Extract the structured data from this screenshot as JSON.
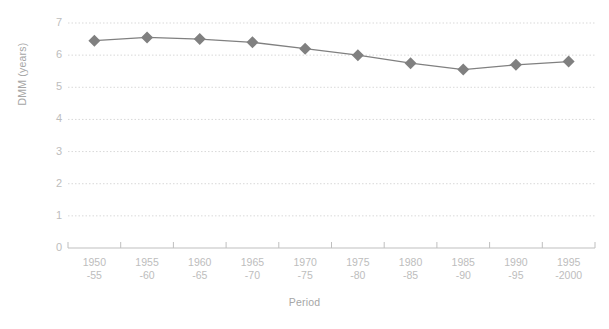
{
  "chart_data": {
    "type": "line",
    "title": "",
    "xlabel": "Period",
    "ylabel": "DMM (years)",
    "ylim": [
      0,
      7
    ],
    "y_ticks": [
      "0",
      "1",
      "2",
      "3",
      "4",
      "5",
      "6",
      "7"
    ],
    "grid": "horizontal-dotted",
    "legend": "none",
    "marker": "diamond",
    "series_color": "#808080",
    "grid_color": "#d9d9d9",
    "axis_color": "#bfbfbf",
    "tick_label_color": "#bdbdbd",
    "categories": [
      "1950-55",
      "1955-60",
      "1960-65",
      "1965-70",
      "1970-75",
      "1975-80",
      "1980-85",
      "1985-90",
      "1990-95",
      "1995-2000"
    ],
    "category_labels": [
      {
        "line1": "1950",
        "line2": "-55"
      },
      {
        "line1": "1955",
        "line2": "-60"
      },
      {
        "line1": "1960",
        "line2": "-65"
      },
      {
        "line1": "1965",
        "line2": "-70"
      },
      {
        "line1": "1970",
        "line2": "-75"
      },
      {
        "line1": "1975",
        "line2": "-80"
      },
      {
        "line1": "1980",
        "line2": "-85"
      },
      {
        "line1": "1985",
        "line2": "-90"
      },
      {
        "line1": "1990",
        "line2": "-95"
      },
      {
        "line1": "1995",
        "line2": "-2000"
      }
    ],
    "values": [
      6.45,
      6.55,
      6.5,
      6.4,
      6.2,
      6.0,
      5.75,
      5.55,
      5.7,
      5.8
    ]
  }
}
